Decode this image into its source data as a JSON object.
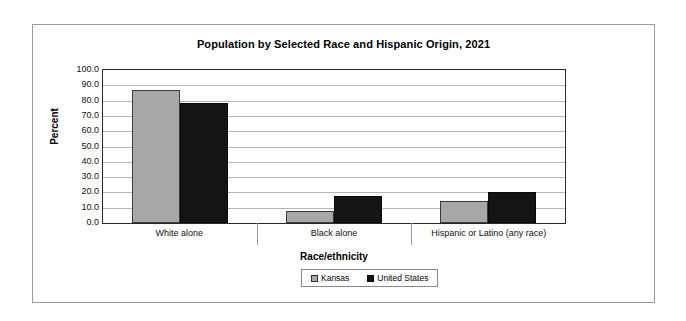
{
  "chart_data": {
    "type": "bar",
    "title": "Population by Selected Race and Hispanic Origin, 2021",
    "xlabel": "Race/ethnicity",
    "ylabel": "Percent",
    "categories": [
      "White alone",
      "Black alone",
      "Hispanic or Latino (any race)"
    ],
    "series": [
      {
        "name": "Kansas",
        "color": "#a8a8a8",
        "values": [
          86.9,
          7.8,
          14.4
        ]
      },
      {
        "name": "United States",
        "color": "#141414",
        "values": [
          78.4,
          17.6,
          20.3
        ]
      }
    ],
    "ylim": [
      0,
      100
    ],
    "ytick_step": 10,
    "ytick_labels": [
      "100.0",
      "90.0",
      "80.0",
      "70.0",
      "60.0",
      "50.0",
      "40.0",
      "30.0",
      "20.0",
      "10.0",
      "0.0"
    ],
    "grid": true,
    "legend_position": "bottom"
  },
  "legend": {
    "items": [
      {
        "label": "Kansas"
      },
      {
        "label": "United States"
      }
    ]
  }
}
